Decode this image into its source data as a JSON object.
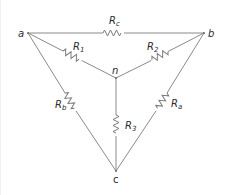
{
  "diagram": {
    "type": "circuit-schematic",
    "nodes": [
      {
        "id": "a",
        "label": "a",
        "x": 28,
        "y": 33
      },
      {
        "id": "b",
        "label": "b",
        "x": 204,
        "y": 33
      },
      {
        "id": "n",
        "label": "n",
        "x": 116,
        "y": 78
      },
      {
        "id": "c",
        "label": "c",
        "x": 116,
        "y": 171
      }
    ],
    "resistors": [
      {
        "id": "Rc",
        "main": "R",
        "sub": "c",
        "from": "a",
        "to": "b",
        "network": "delta"
      },
      {
        "id": "Rb",
        "main": "R",
        "sub": "b",
        "from": "a",
        "to": "c",
        "network": "delta"
      },
      {
        "id": "Ra",
        "main": "R",
        "sub": "a",
        "from": "b",
        "to": "c",
        "network": "delta"
      },
      {
        "id": "R1",
        "main": "R",
        "sub": "1",
        "from": "a",
        "to": "n",
        "network": "wye"
      },
      {
        "id": "R2",
        "main": "R",
        "sub": "2",
        "from": "b",
        "to": "n",
        "network": "wye"
      },
      {
        "id": "R3",
        "main": "R",
        "sub": "3",
        "from": "n",
        "to": "c",
        "network": "wye"
      }
    ],
    "colors": {
      "wire": "#8a8a8a",
      "text": "#2a2a2a",
      "background": "#ffffff"
    }
  }
}
